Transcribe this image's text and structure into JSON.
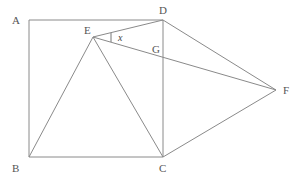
{
  "figure": {
    "background_color": "#ffffff",
    "line_color": "#8a8a8a",
    "label_color": "#555555"
  },
  "points": {
    "A": {
      "label": "A",
      "x": 29,
      "y": 20,
      "label_x": 12,
      "label_y": 24
    },
    "B": {
      "label": "B",
      "x": 29,
      "y": 157,
      "label_x": 12,
      "label_y": 172
    },
    "C": {
      "label": "C",
      "x": 163,
      "y": 157,
      "label_x": 159,
      "label_y": 172
    },
    "D": {
      "label": "D",
      "x": 163,
      "y": 20,
      "label_x": 159,
      "label_y": 14
    },
    "E": {
      "label": "E",
      "x": 93,
      "y": 37,
      "label_x": 84,
      "label_y": 34
    },
    "F": {
      "label": "F",
      "x": 276,
      "y": 90,
      "label_x": 283,
      "label_y": 94
    },
    "G": {
      "label": "G",
      "x": 163,
      "y": 57,
      "label_x": 152,
      "label_y": 53
    }
  },
  "segments": [
    {
      "name": "AB",
      "from": "A",
      "to": "B"
    },
    {
      "name": "AD",
      "from": "A",
      "to": "D"
    },
    {
      "name": "BC",
      "from": "B",
      "to": "C"
    },
    {
      "name": "DC",
      "from": "D",
      "to": "C"
    },
    {
      "name": "EB",
      "from": "E",
      "to": "B"
    },
    {
      "name": "EC",
      "from": "E",
      "to": "C"
    },
    {
      "name": "ED",
      "from": "E",
      "to": "D"
    },
    {
      "name": "EF",
      "from": "E",
      "to": "F"
    },
    {
      "name": "DF",
      "from": "D",
      "to": "F"
    },
    {
      "name": "CF",
      "from": "C",
      "to": "F"
    }
  ],
  "angles": [
    {
      "name": "angle-x-at-E",
      "label": "x",
      "vertex": "E",
      "between": [
        "ED",
        "EF"
      ],
      "label_x": 118,
      "label_y": 41,
      "tick_x1": 111,
      "tick_y1": 33,
      "tick_x2": 111,
      "tick_y2": 42
    }
  ]
}
